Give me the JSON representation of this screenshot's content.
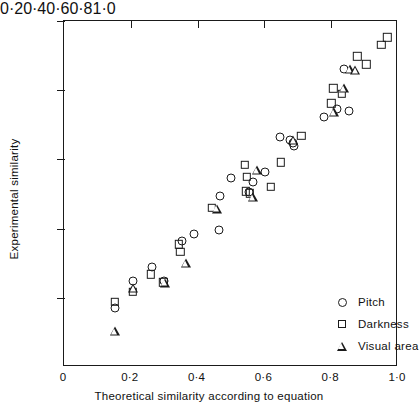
{
  "chart_data": {
    "type": "scatter",
    "title": "",
    "xlabel": "Theoretical similarity according to equation",
    "ylabel": "Experimental similarity",
    "xlim": [
      0,
      1.0
    ],
    "ylim": [
      0,
      1.0
    ],
    "grid": false,
    "xticks": [
      "0",
      "0·2",
      "0·4",
      "0·6",
      "0·8",
      "1·0"
    ],
    "xtick_values": [
      0,
      0.2,
      0.4,
      0.6,
      0.8,
      1.0
    ],
    "yticks": [
      "0·2",
      "0·4",
      "0·6",
      "0·8",
      "1·0"
    ],
    "ytick_values": [
      0.2,
      0.4,
      0.6,
      0.8,
      1.0
    ],
    "legend_position": "lower-right",
    "series": [
      {
        "name": "Pitch",
        "marker": "circle",
        "points": [
          [
            0.152,
            0.17
          ],
          [
            0.206,
            0.25
          ],
          [
            0.262,
            0.288
          ],
          [
            0.3,
            0.25
          ],
          [
            0.353,
            0.365
          ],
          [
            0.389,
            0.385
          ],
          [
            0.464,
            0.395
          ],
          [
            0.466,
            0.495
          ],
          [
            0.5,
            0.545
          ],
          [
            0.553,
            0.505
          ],
          [
            0.566,
            0.535
          ],
          [
            0.601,
            0.565
          ],
          [
            0.646,
            0.665
          ],
          [
            0.676,
            0.655
          ],
          [
            0.686,
            0.648
          ],
          [
            0.69,
            0.64
          ],
          [
            0.779,
            0.722
          ],
          [
            0.818,
            0.745
          ],
          [
            0.838,
            0.862
          ],
          [
            0.853,
            0.74
          ]
        ]
      },
      {
        "name": "Darkness",
        "marker": "square",
        "points": [
          [
            0.152,
            0.188
          ],
          [
            0.206,
            0.218
          ],
          [
            0.259,
            0.268
          ],
          [
            0.297,
            0.245
          ],
          [
            0.344,
            0.355
          ],
          [
            0.348,
            0.333
          ],
          [
            0.443,
            0.46
          ],
          [
            0.542,
            0.585
          ],
          [
            0.547,
            0.55
          ],
          [
            0.545,
            0.508
          ],
          [
            0.557,
            0.502
          ],
          [
            0.62,
            0.52
          ],
          [
            0.65,
            0.592
          ],
          [
            0.71,
            0.668
          ],
          [
            0.8,
            0.762
          ],
          [
            0.806,
            0.805
          ],
          [
            0.832,
            0.79
          ],
          [
            0.878,
            0.898
          ],
          [
            0.905,
            0.875
          ],
          [
            0.95,
            0.932
          ],
          [
            0.968,
            0.953
          ]
        ]
      },
      {
        "name": "Visual area",
        "marker": "triangle",
        "points": [
          [
            0.152,
            0.105
          ],
          [
            0.208,
            0.228
          ],
          [
            0.301,
            0.244
          ],
          [
            0.365,
            0.3
          ],
          [
            0.458,
            0.458
          ],
          [
            0.566,
            0.49
          ],
          [
            0.578,
            0.57
          ],
          [
            0.686,
            0.655
          ],
          [
            0.808,
            0.738
          ],
          [
            0.838,
            0.805
          ],
          [
            0.855,
            0.862
          ],
          [
            0.872,
            0.858
          ]
        ]
      }
    ]
  },
  "legend": {
    "items": [
      {
        "label": "Pitch",
        "marker": "circle"
      },
      {
        "label": "Darkness",
        "marker": "square"
      },
      {
        "label": "Visual area",
        "marker": "triangle"
      }
    ]
  }
}
